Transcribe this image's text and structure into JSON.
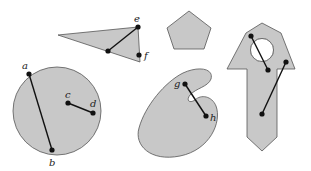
{
  "diagram": {
    "colors": {
      "fill": "#c8c8c8",
      "stroke": "#555555",
      "segment": "#111111",
      "background": "#ffffff"
    },
    "shapes": [
      {
        "name": "circle",
        "convex": true,
        "segments": [
          [
            "a",
            "b"
          ],
          [
            "c",
            "d"
          ]
        ]
      },
      {
        "name": "triangle",
        "convex": true,
        "segments": [
          [
            "e",
            "interior"
          ]
        ],
        "boundary_points": [
          "e",
          "f"
        ]
      },
      {
        "name": "pentagon",
        "convex": true,
        "segments": []
      },
      {
        "name": "kidney-blob",
        "convex": false,
        "segments": [
          [
            "g",
            "h"
          ]
        ]
      },
      {
        "name": "arrow-with-hole",
        "convex": false,
        "segments": [
          [
            "p1",
            "p2"
          ],
          [
            "p3",
            "p4"
          ]
        ]
      }
    ],
    "labels": {
      "a": "a",
      "b": "b",
      "c": "c",
      "d": "d",
      "e": "e",
      "f": "f",
      "g": "g",
      "h": "h"
    }
  }
}
